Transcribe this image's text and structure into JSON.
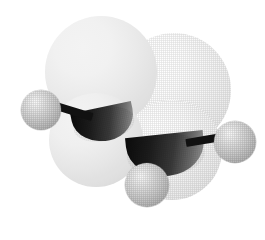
{
  "scene": {
    "title": "Molecular model",
    "description": "Three-dimensional space-filling and ball-and-stick hybrid model of a molecule",
    "molecule_label": "ethane-like hydrocarbon fragment",
    "background_color": "#ffffff",
    "width": 265,
    "height": 240,
    "render_style": "dithered raster / halftone shading"
  },
  "palette": {
    "background": "#ffffff",
    "vdw_sphere_light": "#ffffff",
    "vdw_sphere_shadow": "#d6d6d6",
    "hydrogen_light": "#fafafa",
    "hydrogen_mid": "#c8c8c8",
    "hydrogen_shadow": "#969696",
    "bond_black": "#111111",
    "socket_dark": "#0a0a0a",
    "socket_mid": "#3a3a3a"
  },
  "atoms": {
    "vdw_spheres": [
      {
        "name": "carbon-vdw-upper-left",
        "label": "C",
        "cx": 101,
        "cy": 72,
        "r": 56
      },
      {
        "name": "carbon-vdw-upper-right",
        "label": "C",
        "cx": 174,
        "cy": 90,
        "r": 57
      },
      {
        "name": "carbon-vdw-lower-left",
        "label": "C",
        "cx": 96,
        "cy": 140,
        "r": 47
      },
      {
        "name": "carbon-vdw-lower-right",
        "label": "C",
        "cx": 172,
        "cy": 150,
        "r": 50
      }
    ],
    "hydrogens": [
      {
        "name": "hydrogen-left",
        "label": "H",
        "cx": 41,
        "cy": 110,
        "r": 20
      },
      {
        "name": "hydrogen-right",
        "label": "H",
        "cx": 235,
        "cy": 142,
        "r": 21
      },
      {
        "name": "hydrogen-bottom",
        "label": "H",
        "cx": 147,
        "cy": 185,
        "r": 22
      }
    ]
  },
  "bonds": [
    {
      "name": "bond-left",
      "from": "hydrogen-left",
      "to": "carbon-vdw-upper-left",
      "x1": 56,
      "y1": 106,
      "x2": 92,
      "y2": 117,
      "width": 8
    },
    {
      "name": "bond-right",
      "from": "hydrogen-right",
      "to": "carbon-vdw-lower-right",
      "x1": 186,
      "y1": 143,
      "x2": 222,
      "y2": 137,
      "width": 8
    }
  ],
  "sockets": [
    {
      "name": "bond-socket-upper",
      "cx": 104,
      "cy": 124,
      "w": 62,
      "h": 34,
      "rotate": -12
    },
    {
      "name": "bond-socket-lower",
      "cx": 166,
      "cy": 155,
      "w": 78,
      "h": 42,
      "rotate": -6
    }
  ]
}
